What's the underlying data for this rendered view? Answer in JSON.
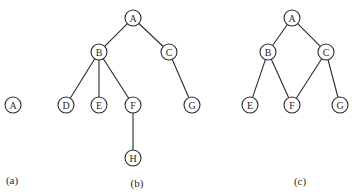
{
  "top_text_fragment": "",
  "node_radius": 8,
  "colors": {
    "stroke": "#2a2a2a",
    "background": "#ffffff"
  },
  "graphs": [
    {
      "id": "a",
      "caption": "(a)",
      "caption_pos": [
        12,
        184
      ],
      "nodes": [
        {
          "id": "A",
          "label": "A",
          "x": 13,
          "y": 105
        }
      ],
      "edges": []
    },
    {
      "id": "b",
      "caption": "(b)",
      "caption_pos": [
        137,
        187
      ],
      "nodes": [
        {
          "id": "A",
          "label": "A",
          "x": 133,
          "y": 18
        },
        {
          "id": "B",
          "label": "B",
          "x": 99,
          "y": 52
        },
        {
          "id": "C",
          "label": "C",
          "x": 169,
          "y": 52
        },
        {
          "id": "D",
          "label": "D",
          "x": 66,
          "y": 105
        },
        {
          "id": "E",
          "label": "E",
          "x": 99,
          "y": 105
        },
        {
          "id": "F",
          "label": "F",
          "x": 133,
          "y": 105
        },
        {
          "id": "G",
          "label": "G",
          "x": 192,
          "y": 105
        },
        {
          "id": "H",
          "label": "H",
          "x": 133,
          "y": 158
        }
      ],
      "edges": [
        [
          "A",
          "B"
        ],
        [
          "A",
          "C"
        ],
        [
          "B",
          "D"
        ],
        [
          "B",
          "E"
        ],
        [
          "B",
          "F"
        ],
        [
          "C",
          "G"
        ],
        [
          "F",
          "H"
        ]
      ]
    },
    {
      "id": "c",
      "caption": "(c)",
      "caption_pos": [
        300,
        185
      ],
      "nodes": [
        {
          "id": "A",
          "label": "A",
          "x": 292,
          "y": 18
        },
        {
          "id": "B",
          "label": "B",
          "x": 268,
          "y": 52
        },
        {
          "id": "C",
          "label": "C",
          "x": 326,
          "y": 52
        },
        {
          "id": "E",
          "label": "E",
          "x": 250,
          "y": 105
        },
        {
          "id": "F",
          "label": "F",
          "x": 292,
          "y": 105
        },
        {
          "id": "G",
          "label": "G",
          "x": 340,
          "y": 105
        }
      ],
      "edges": [
        [
          "A",
          "B"
        ],
        [
          "A",
          "C"
        ],
        [
          "B",
          "E"
        ],
        [
          "B",
          "F"
        ],
        [
          "C",
          "F"
        ],
        [
          "C",
          "G"
        ]
      ]
    }
  ]
}
